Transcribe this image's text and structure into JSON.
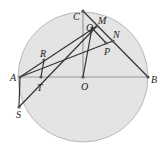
{
  "diagram": {
    "circle": {
      "cx": 83,
      "cy": 77,
      "r": 65,
      "fill": "#e4e4e4",
      "stroke": "#b8b8b8"
    },
    "points": {
      "A": {
        "x": 20,
        "y": 77
      },
      "B": {
        "x": 148,
        "y": 77
      },
      "O": {
        "x": 83,
        "y": 77
      },
      "C": {
        "x": 83,
        "y": 11
      },
      "M": {
        "x": 97,
        "y": 26
      },
      "Q": {
        "x": 92,
        "y": 28
      },
      "N": {
        "x": 113,
        "y": 41
      },
      "P": {
        "x": 106,
        "y": 43
      },
      "R": {
        "x": 44,
        "y": 60
      },
      "T": {
        "x": 41,
        "y": 77
      },
      "S": {
        "x": 19,
        "y": 107
      }
    },
    "labels": {
      "A": "A",
      "B": "B",
      "O": "O",
      "C": "C",
      "M": "M",
      "Q": "Q",
      "N": "N",
      "P": "P",
      "R": "R",
      "T": "T",
      "S": "S"
    },
    "line_color": "#333333",
    "axis_color": "#999999"
  }
}
